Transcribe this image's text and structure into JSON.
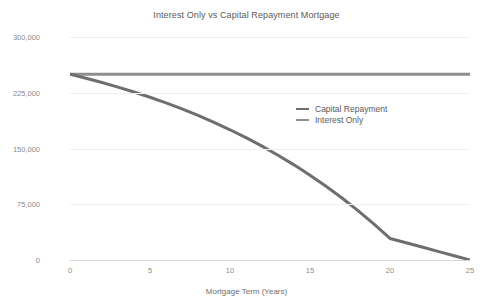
{
  "chart_data": {
    "type": "line",
    "title": "Interest Only vs Capital Repayment Mortgage",
    "xlabel": "Mortgage Term (Years)",
    "ylabel": "Mortgage Balance (£)",
    "xlim": [
      0,
      25
    ],
    "ylim": [
      0,
      300000
    ],
    "xticks": [
      0,
      5,
      10,
      15,
      20,
      25
    ],
    "xtick_labels": [
      "0",
      "5",
      "10",
      "15",
      "20",
      "25"
    ],
    "yticks": [
      0,
      75000,
      150000,
      225000,
      300000
    ],
    "ytick_labels": [
      "0",
      "75,000",
      "150,000",
      "225,000",
      "300,000"
    ],
    "grid": true,
    "legend_position": "center-right",
    "x": [
      0,
      1,
      2,
      3,
      4,
      5,
      6,
      7,
      8,
      9,
      10,
      11,
      12,
      13,
      14,
      15,
      16,
      17,
      18,
      19,
      20,
      21,
      22,
      23,
      24,
      25
    ],
    "series": [
      {
        "name": "Capital Repayment",
        "color": "#6e6e6e",
        "values": [
          250000,
          244600,
          238800,
          232600,
          226000,
          218900,
          211300,
          203200,
          194500,
          185200,
          175200,
          164600,
          153200,
          141000,
          128000,
          114100,
          99200,
          83400,
          66400,
          48300,
          29000,
          23200,
          17400,
          11600,
          5800,
          0
        ]
      },
      {
        "name": "Interest Only",
        "color": "#8e8e8e",
        "values": [
          250000,
          250000,
          250000,
          250000,
          250000,
          250000,
          250000,
          250000,
          250000,
          250000,
          250000,
          250000,
          250000,
          250000,
          250000,
          250000,
          250000,
          250000,
          250000,
          250000,
          250000,
          250000,
          250000,
          250000,
          250000,
          250000
        ]
      }
    ]
  },
  "legend": {
    "items": [
      {
        "label": "Capital Repayment"
      },
      {
        "label": "Interest Only"
      }
    ]
  },
  "colors": {
    "capital_repayment": "#6e6e6e",
    "interest_only": "#8e8e8e",
    "gridline": "#f0f0f0",
    "axis": "#d8d8d8",
    "text": "#6e6e6e",
    "tick_text": "#8a8a8a",
    "background": "#ffffff"
  }
}
